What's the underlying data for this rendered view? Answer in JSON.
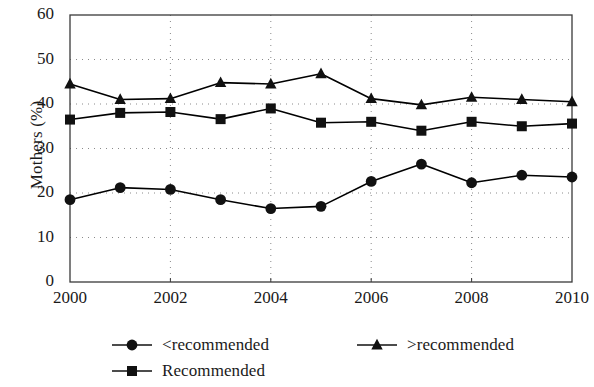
{
  "chart_data": {
    "type": "line",
    "title": "",
    "xlabel": "",
    "ylabel": "Mothers (%)",
    "xlim": [
      2000,
      2010
    ],
    "ylim": [
      0,
      60
    ],
    "ytick_labels": [
      "0",
      "10",
      "20",
      "30",
      "40",
      "50",
      "60"
    ],
    "ytick_values": [
      0,
      10,
      20,
      30,
      40,
      50,
      60
    ],
    "xtick_labels": [
      "2000",
      "2002",
      "2004",
      "2006",
      "2008",
      "2010"
    ],
    "xtick_values": [
      2000,
      2002,
      2004,
      2006,
      2008,
      2010
    ],
    "x": [
      2000,
      2001,
      2002,
      2003,
      2004,
      2005,
      2006,
      2007,
      2008,
      2009,
      2010
    ],
    "grid": "dotted",
    "legend_position": "below-plot",
    "series": [
      {
        "name": "<recommended",
        "marker": "circle",
        "color": "#000000",
        "values": [
          18.5,
          21.2,
          20.8,
          18.5,
          16.5,
          17.0,
          22.6,
          26.5,
          22.3,
          24.0,
          23.6
        ]
      },
      {
        "name": "Recommended",
        "marker": "square",
        "color": "#000000",
        "values": [
          36.5,
          38.0,
          38.2,
          36.6,
          39.0,
          35.8,
          36.0,
          34.0,
          36.0,
          35.0,
          35.6
        ]
      },
      {
        "name": ">recommended",
        "marker": "triangle",
        "color": "#000000",
        "values": [
          44.5,
          41.0,
          41.2,
          44.8,
          44.5,
          46.8,
          41.2,
          39.8,
          41.5,
          41.0,
          40.5
        ]
      }
    ]
  },
  "axes": {
    "y_title": "Mothers (%)"
  },
  "legend": {
    "items": [
      {
        "label": "<recommended",
        "marker": "circle"
      },
      {
        "label": ">recommended",
        "marker": "triangle"
      },
      {
        "label": "Recommended",
        "marker": "square"
      }
    ]
  }
}
